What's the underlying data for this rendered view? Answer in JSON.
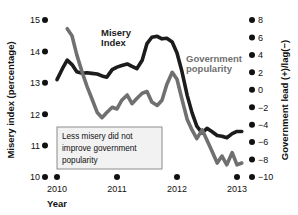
{
  "chart_data": {
    "type": "line",
    "title": "",
    "xlabel": "Year",
    "ylabel": "Misery index (percentage)",
    "y2label": "Government lead (+)/lag(−)",
    "grid": false,
    "legend_position": "inline-annotations",
    "xlim": [
      2010.0,
      2013.1
    ],
    "ylim": [
      10,
      15
    ],
    "y2lim": [
      -10,
      8
    ],
    "xticks": [
      "2010",
      "2011",
      "2012",
      "2013"
    ],
    "xtick_values": [
      2010,
      2011,
      2012,
      2013
    ],
    "yticks": [
      "10",
      "11",
      "12",
      "13",
      "14",
      "15"
    ],
    "ytick_values": [
      10,
      11,
      12,
      13,
      14,
      15
    ],
    "y2ticks": [
      "8",
      "6",
      "4",
      "2",
      "0",
      "−2",
      "−4",
      "−6",
      "−8",
      "−10"
    ],
    "y2tick_values": [
      8,
      6,
      4,
      2,
      0,
      -2,
      -4,
      -6,
      -8,
      -10
    ],
    "annotations": [
      {
        "name": "callout-box",
        "lines": [
          "Less misery did not",
          "improve government",
          "popularity"
        ]
      }
    ],
    "series": [
      {
        "name": "Misery Index",
        "label": "Misery Index",
        "axis": "left",
        "color": "#1c1c1c",
        "x": [
          2010.0,
          2010.09,
          2010.17,
          2010.25,
          2010.33,
          2010.42,
          2010.5,
          2010.58,
          2010.67,
          2010.75,
          2010.83,
          2010.92,
          2011.0,
          2011.08,
          2011.17,
          2011.25,
          2011.33,
          2011.42,
          2011.5,
          2011.58,
          2011.67,
          2011.75,
          2011.83,
          2011.92,
          2012.0,
          2012.08,
          2012.17,
          2012.25,
          2012.33,
          2012.42,
          2012.5,
          2012.58,
          2012.67,
          2012.75,
          2012.83,
          2012.92,
          2013.0,
          2013.08
        ],
        "y": [
          13.1,
          13.45,
          13.72,
          13.58,
          13.35,
          13.3,
          13.32,
          13.3,
          13.28,
          13.22,
          13.18,
          13.42,
          13.5,
          13.55,
          13.6,
          13.52,
          13.45,
          13.72,
          14.25,
          14.45,
          14.48,
          14.4,
          14.42,
          14.3,
          13.95,
          13.38,
          12.6,
          12.05,
          11.62,
          11.4,
          11.55,
          11.45,
          11.32,
          11.3,
          11.25,
          11.38,
          11.45,
          11.45
        ]
      },
      {
        "name": "Government popularity",
        "label": "Government popularity",
        "axis": "right",
        "color": "#707070",
        "x": [
          2010.17,
          2010.25,
          2010.33,
          2010.42,
          2010.5,
          2010.58,
          2010.67,
          2010.75,
          2010.83,
          2010.92,
          2011.0,
          2011.08,
          2011.17,
          2011.25,
          2011.33,
          2011.42,
          2011.5,
          2011.58,
          2011.67,
          2011.75,
          2011.83,
          2011.92,
          2012.0,
          2012.08,
          2012.17,
          2012.25,
          2012.33,
          2012.42,
          2012.5,
          2012.58,
          2012.67,
          2012.75,
          2012.83,
          2012.92,
          2013.0,
          2013.08
        ],
        "y": [
          7.0,
          6.2,
          4.0,
          2.0,
          0.4,
          -1.0,
          -2.6,
          -3.2,
          -2.6,
          -2.0,
          -2.2,
          -1.2,
          -0.6,
          -1.6,
          -1.0,
          -0.4,
          -0.2,
          -1.4,
          -1.8,
          -1.2,
          0.6,
          2.0,
          1.2,
          -1.0,
          -3.4,
          -4.6,
          -5.6,
          -4.6,
          -5.8,
          -7.0,
          -8.4,
          -7.6,
          -8.6,
          -7.2,
          -8.6,
          -8.4
        ]
      }
    ]
  },
  "axis": {
    "left_title": "Misery index (percentage)",
    "right_title": "Government lead (+)/lag(−)",
    "x_title": "Year"
  }
}
